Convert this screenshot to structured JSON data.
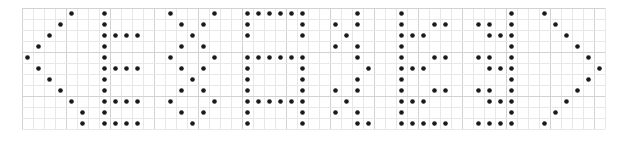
{
  "canvas": {
    "width": 620,
    "height": 142,
    "background_color": "#ffffff"
  },
  "grid": {
    "origin_x": 22,
    "origin_y": 8,
    "cell_size": 11,
    "cols": 53,
    "rows": 11,
    "minor_color": "#e8e8e8",
    "major_color": "#d2d2d2",
    "major_every": 4,
    "visible": true
  },
  "dot_matrix": {
    "text": "<EXAMPLE>",
    "dot_color": "#1a1a1a",
    "dot_radius": 2.3,
    "glyphs": [
      {
        "char": "<",
        "name": "less-than-bracket",
        "col_offset": 0,
        "cells": [
          [
            4,
            0
          ],
          [
            3,
            1
          ],
          [
            2,
            2
          ],
          [
            1,
            3
          ],
          [
            0,
            4
          ],
          [
            1,
            5
          ],
          [
            2,
            6
          ],
          [
            3,
            7
          ],
          [
            4,
            8
          ],
          [
            5,
            9
          ],
          [
            5,
            10
          ]
        ]
      },
      {
        "char": "E",
        "name": "letter-e",
        "col_offset": 7,
        "cells": [
          [
            0,
            0
          ],
          [
            0,
            1
          ],
          [
            0,
            2
          ],
          [
            0,
            3
          ],
          [
            0,
            4
          ],
          [
            0,
            5
          ],
          [
            0,
            6
          ],
          [
            0,
            7
          ],
          [
            0,
            8
          ],
          [
            0,
            9
          ],
          [
            0,
            10
          ],
          [
            1,
            2
          ],
          [
            2,
            2
          ],
          [
            3,
            2
          ],
          [
            1,
            5
          ],
          [
            2,
            5
          ],
          [
            3,
            5
          ],
          [
            1,
            8
          ],
          [
            2,
            8
          ],
          [
            3,
            8
          ],
          [
            1,
            10
          ],
          [
            2,
            10
          ],
          [
            3,
            10
          ]
        ]
      },
      {
        "char": "X",
        "name": "letter-x",
        "col_offset": 13,
        "cells": [
          [
            0,
            0
          ],
          [
            4,
            0
          ],
          [
            1,
            1
          ],
          [
            3,
            1
          ],
          [
            2,
            2
          ],
          [
            1,
            3
          ],
          [
            3,
            3
          ],
          [
            0,
            4
          ],
          [
            4,
            4
          ],
          [
            1,
            5
          ],
          [
            3,
            5
          ],
          [
            2,
            6
          ],
          [
            1,
            7
          ],
          [
            3,
            7
          ],
          [
            0,
            8
          ],
          [
            4,
            8
          ],
          [
            1,
            9
          ],
          [
            3,
            9
          ],
          [
            2,
            10
          ]
        ]
      },
      {
        "char": "A",
        "name": "letter-a",
        "col_offset": 20,
        "cells": [
          [
            0,
            0
          ],
          [
            1,
            0
          ],
          [
            2,
            0
          ],
          [
            3,
            0
          ],
          [
            4,
            0
          ],
          [
            5,
            0
          ],
          [
            0,
            1
          ],
          [
            5,
            1
          ],
          [
            0,
            2
          ],
          [
            5,
            2
          ],
          [
            0,
            4
          ],
          [
            1,
            4
          ],
          [
            2,
            4
          ],
          [
            3,
            4
          ],
          [
            4,
            4
          ],
          [
            5,
            4
          ],
          [
            0,
            5
          ],
          [
            5,
            5
          ],
          [
            0,
            6
          ],
          [
            5,
            6
          ],
          [
            0,
            7
          ],
          [
            5,
            7
          ],
          [
            0,
            8
          ],
          [
            1,
            8
          ],
          [
            2,
            8
          ],
          [
            3,
            8
          ],
          [
            4,
            8
          ],
          [
            5,
            8
          ],
          [
            0,
            9
          ],
          [
            5,
            9
          ],
          [
            0,
            10
          ],
          [
            5,
            10
          ]
        ]
      },
      {
        "char": "V",
        "name": "letter-v",
        "col_offset": 28,
        "cells": [
          [
            2,
            0
          ],
          [
            0,
            1
          ],
          [
            2,
            1
          ],
          [
            1,
            2
          ],
          [
            0,
            3
          ],
          [
            2,
            3
          ],
          [
            2,
            4
          ],
          [
            3,
            5
          ],
          [
            2,
            6
          ],
          [
            0,
            7
          ],
          [
            2,
            7
          ],
          [
            1,
            8
          ],
          [
            0,
            9
          ],
          [
            2,
            9
          ],
          [
            2,
            10
          ],
          [
            3,
            10
          ]
        ]
      },
      {
        "char": "M",
        "name": "letter-m",
        "col_offset": 34,
        "cells": [
          [
            0,
            0
          ],
          [
            0,
            1
          ],
          [
            0,
            2
          ],
          [
            0,
            3
          ],
          [
            0,
            4
          ],
          [
            0,
            5
          ],
          [
            0,
            6
          ],
          [
            0,
            7
          ],
          [
            0,
            8
          ],
          [
            0,
            9
          ],
          [
            0,
            10
          ],
          [
            1,
            2
          ],
          [
            2,
            2
          ],
          [
            1,
            5
          ],
          [
            2,
            5
          ],
          [
            1,
            8
          ],
          [
            2,
            8
          ],
          [
            1,
            10
          ],
          [
            2,
            10
          ],
          [
            3,
            1
          ],
          [
            4,
            1
          ],
          [
            3,
            4
          ],
          [
            4,
            4
          ],
          [
            3,
            7
          ],
          [
            4,
            7
          ],
          [
            3,
            10
          ],
          [
            4,
            10
          ]
        ]
      },
      {
        "char": "L",
        "name": "letter-l",
        "col_offset": 41,
        "cells": [
          [
            3,
            0
          ],
          [
            3,
            1
          ],
          [
            3,
            2
          ],
          [
            3,
            3
          ],
          [
            3,
            4
          ],
          [
            3,
            5
          ],
          [
            3,
            6
          ],
          [
            3,
            7
          ],
          [
            3,
            8
          ],
          [
            3,
            9
          ],
          [
            3,
            10
          ],
          [
            0,
            1
          ],
          [
            1,
            1
          ],
          [
            1,
            2
          ],
          [
            2,
            2
          ],
          [
            0,
            4
          ],
          [
            1,
            4
          ],
          [
            1,
            5
          ],
          [
            2,
            5
          ],
          [
            0,
            7
          ],
          [
            1,
            7
          ],
          [
            1,
            8
          ],
          [
            2,
            8
          ],
          [
            0,
            10
          ],
          [
            1,
            10
          ],
          [
            2,
            10
          ]
        ]
      },
      {
        "char": ">",
        "name": "greater-than-bracket",
        "col_offset": 47,
        "cells": [
          [
            0,
            0
          ],
          [
            1,
            1
          ],
          [
            2,
            2
          ],
          [
            3,
            3
          ],
          [
            4,
            4
          ],
          [
            5,
            5
          ],
          [
            4,
            6
          ],
          [
            3,
            7
          ],
          [
            2,
            8
          ],
          [
            1,
            9
          ],
          [
            0,
            10
          ]
        ]
      }
    ]
  }
}
